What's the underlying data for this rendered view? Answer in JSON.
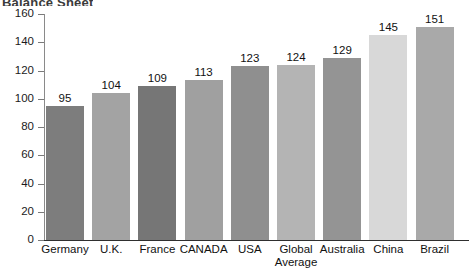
{
  "chart_data": {
    "type": "bar",
    "title": "",
    "title_clipped_fragment": "Balance Sheet",
    "xlabel": "",
    "ylabel": "",
    "ylim": [
      0,
      160
    ],
    "y_ticks": [
      0,
      20,
      40,
      60,
      80,
      100,
      120,
      140,
      160
    ],
    "grid": false,
    "legend": "none",
    "categories": [
      "Germany",
      "U.K.",
      "France",
      "CANADA",
      "USA",
      "Global Average",
      "Australia",
      "China",
      "Brazil"
    ],
    "values": [
      95,
      104,
      109,
      113,
      123,
      124,
      129,
      145,
      151
    ],
    "bar_colors": [
      "#7d7d7d",
      "#a3a3a3",
      "#767676",
      "#a0a0a0",
      "#8f8f8f",
      "#b4b4b4",
      "#949494",
      "#d8d8d8",
      "#a9a9a9"
    ],
    "data_labels_shown": true
  },
  "axis": {
    "tick_labels": [
      "160",
      "140",
      "120",
      "100",
      "80",
      "60",
      "40",
      "20",
      "0"
    ]
  }
}
